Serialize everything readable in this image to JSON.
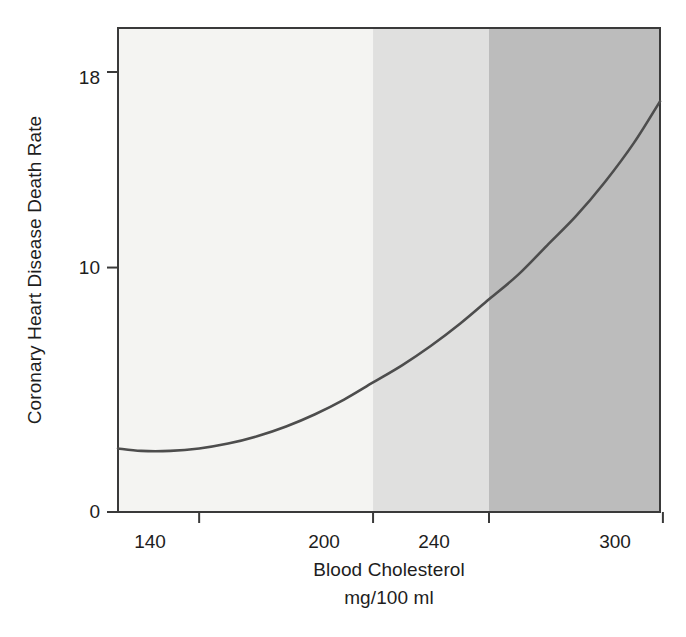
{
  "figure": {
    "background": "#ffffff",
    "plot_frame_color": "#3a3a3a"
  },
  "axes": {
    "y_title": "Coronary Heart Disease Death Rate",
    "x_title_line1": "Blood Cholesterol",
    "x_title_line2": "mg/100 ml",
    "y_ticks": [
      "0",
      "10",
      "18"
    ],
    "x_ticks": [
      "140",
      "200",
      "240",
      "300"
    ]
  },
  "chart_data": {
    "type": "line",
    "title": "",
    "subtitle": "",
    "xlabel": "Blood Cholesterol mg/100 ml",
    "ylabel": "Coronary Heart Disease Death Rate",
    "xlim": [
      112,
      299
    ],
    "ylim": [
      0,
      19.8
    ],
    "x_ticks": [
      140,
      200,
      240,
      300
    ],
    "y_ticks": [
      0,
      10,
      18
    ],
    "grid": false,
    "legend": "none",
    "line_color": "#4d4d4d",
    "line_width": 2.6,
    "series": [
      {
        "name": "Coronary Heart Disease Death Rate",
        "x": [
          112,
          120,
          130,
          140,
          150,
          160,
          170,
          180,
          190,
          200,
          210,
          220,
          230,
          240,
          250,
          260,
          270,
          280,
          290,
          299
        ],
        "values": [
          2.6,
          2.5,
          2.5,
          2.6,
          2.8,
          3.1,
          3.5,
          4.0,
          4.6,
          5.3,
          6.0,
          6.8,
          7.7,
          8.7,
          9.7,
          10.9,
          12.1,
          13.5,
          15.1,
          16.8
        ]
      }
    ],
    "bands": [
      {
        "name": "desirable",
        "x_start": 112,
        "x_end": 200,
        "color": "#f4f4f2"
      },
      {
        "name": "borderline-high",
        "x_start": 200,
        "x_end": 240,
        "color": "#e0e0df"
      },
      {
        "name": "high",
        "x_start": 240,
        "x_end": 299,
        "color": "#bcbcbc"
      }
    ],
    "annotations": []
  }
}
